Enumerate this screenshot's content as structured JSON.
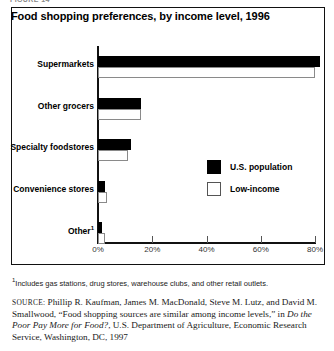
{
  "figure_caption": "FIGURE 14",
  "chart_title": "Food shopping preferences, by income level, 1996",
  "footnote": {
    "marker": "1",
    "text": "Includes gas stations, drug stores, warehouse clubs, and other retail outlets."
  },
  "source": {
    "label": "SOURCE:",
    "part1": " Phillip R. Kaufman, James M. MacDonald, Steve M. Lutz, and David M. Smallwood, “Food shopping sources are similar among income levels,” in ",
    "title_italic": "Do the Poor Pay More for Food?",
    "part2": ", U.S. Department of Agriculture, Economic Research Service, Washington, DC, 1997"
  },
  "legend": {
    "position": "inside-right",
    "entries": [
      {
        "label": "U.S. population",
        "swatch": "dark",
        "color": "#000000"
      },
      {
        "label": "Low-income",
        "swatch": "light",
        "color": "#ffffff"
      }
    ]
  },
  "chart_data": {
    "type": "bar",
    "orientation": "horizontal",
    "title": "Food shopping preferences, by income level, 1996",
    "xlabel": "",
    "ylabel": "",
    "xlim": [
      0,
      85
    ],
    "xticks": [
      0,
      20,
      40,
      60,
      80
    ],
    "xticklabels": [
      "0%",
      "20%",
      "40%",
      "60%",
      "80%"
    ],
    "grid": false,
    "categories": [
      "Supermarkets",
      "Other grocers",
      "Specialty foodstores",
      "Convenience stores",
      "Other"
    ],
    "category_footnote_markers": [
      "",
      "",
      "",
      "",
      "1"
    ],
    "series": [
      {
        "name": "U.S. population",
        "color": "#000000",
        "values": [
          82,
          16,
          12,
          2.5,
          1.5
        ]
      },
      {
        "name": "Low-income",
        "color": "#ffffff",
        "values": [
          80,
          16,
          11,
          3.5,
          2.5
        ]
      }
    ]
  }
}
